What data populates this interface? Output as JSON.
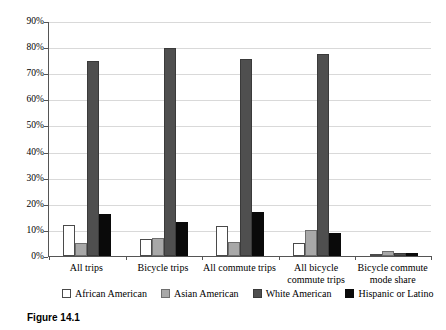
{
  "caption": "Figure 14.1",
  "chart_data": {
    "type": "bar",
    "title": "",
    "xlabel": "",
    "ylabel": "",
    "ylim": [
      0,
      90
    ],
    "ytick_step": 10,
    "ytick_labels": [
      "0%",
      "10%",
      "20%",
      "30%",
      "40%",
      "50%",
      "60%",
      "70%",
      "80%",
      "90%"
    ],
    "grid": true,
    "legend_position": "bottom",
    "categories": [
      "All trips",
      "Bicycle trips",
      "All commute trips",
      "All bicycle commute trips",
      "Bicycle commute mode share"
    ],
    "series": [
      {
        "name": "African American",
        "color": "#ffffff",
        "values": [
          12,
          6.5,
          11.5,
          5,
          0.5
        ]
      },
      {
        "name": "Asian American",
        "color": "#a8a8a8",
        "values": [
          5,
          7,
          5.5,
          10,
          2
        ]
      },
      {
        "name": "White American",
        "color": "#4f4f4f",
        "values": [
          74.5,
          79.5,
          75.5,
          77.5,
          1.3
        ]
      },
      {
        "name": "Hispanic or Latino",
        "color": "#0a0a0a",
        "values": [
          16,
          13,
          17,
          9,
          1
        ]
      }
    ]
  }
}
